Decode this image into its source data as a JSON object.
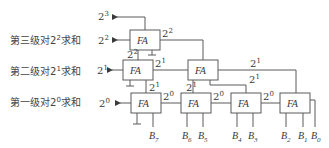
{
  "diagram": {
    "type": "full-adder tree (population count of 8 bits)",
    "row_labels": {
      "level3": {
        "prefix": "第三级对2",
        "exp": "2",
        "suffix": "求和"
      },
      "level2": {
        "prefix": "第二级对2",
        "exp": "1",
        "suffix": "求和"
      },
      "level1": {
        "prefix": "第一级对2",
        "exp": "0",
        "suffix": "求和"
      }
    },
    "outputs": {
      "o3": {
        "base": "2",
        "exp": "3"
      },
      "o2": {
        "base": "2",
        "exp": "2"
      },
      "o1": {
        "base": "2",
        "exp": "1"
      },
      "o0": {
        "base": "2",
        "exp": "0"
      }
    },
    "block_label": "FA",
    "wire_labels": {
      "w_top_right": {
        "base": "2",
        "exp": "2"
      },
      "w_top_left": {
        "base": "2",
        "exp": "2"
      },
      "w_mid_right": {
        "base": "2",
        "exp": "1"
      },
      "w_mid_long": {
        "base": "2",
        "exp": "1"
      },
      "w_mid_down": {
        "base": "2",
        "exp": "1"
      },
      "w_mid_short": {
        "base": "2",
        "exp": "1"
      },
      "w_bot_1": {
        "base": "2",
        "exp": "0"
      },
      "w_bot_2": {
        "base": "2",
        "exp": "0"
      }
    },
    "inputs": [
      {
        "name": "B",
        "sub": "7"
      },
      {
        "name": "B",
        "sub": "6"
      },
      {
        "name": "B",
        "sub": "5"
      },
      {
        "name": "B",
        "sub": "4"
      },
      {
        "name": "B",
        "sub": "3"
      },
      {
        "name": "B",
        "sub": "2"
      },
      {
        "name": "B",
        "sub": "1"
      },
      {
        "name": "B",
        "sub": "0"
      }
    ]
  }
}
